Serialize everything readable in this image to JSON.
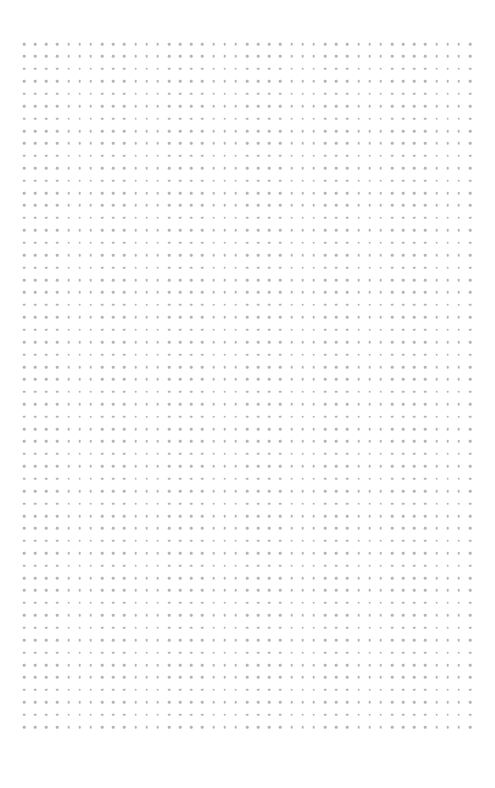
{
  "page": {
    "type": "dot-grid-paper",
    "background": "#ffffff"
  },
  "grid": {
    "columns": 41,
    "rows": 56,
    "origin_x": 24,
    "origin_y": 44,
    "spacing_x": 11.15,
    "spacing_y": 12.42,
    "dot_color": "#b4b4b4",
    "dot_diameter": 2.6
  },
  "footer": {
    "text": ""
  }
}
